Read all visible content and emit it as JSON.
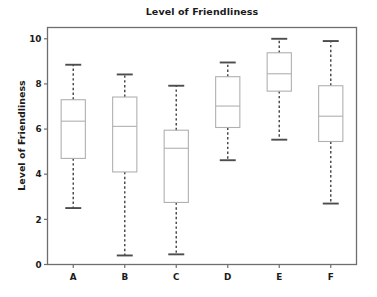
{
  "chart_data": {
    "type": "box",
    "title": "Level of Friendliness",
    "xlabel": "",
    "ylabel": "Level of Friendliness",
    "categories": [
      "A",
      "B",
      "C",
      "D",
      "E",
      "F"
    ],
    "ylim": [
      0,
      10.5
    ],
    "yticks": [
      0,
      2,
      4,
      6,
      8,
      10
    ],
    "ytick_labels": [
      "0",
      "2",
      "4",
      "6",
      "8",
      "10"
    ],
    "grid": false,
    "legend": null,
    "box_color": "#b0b0b0",
    "median_color": "#b0b0b0",
    "whisker_color": "#4d4d4d",
    "cap_color": "#4d4d4d",
    "frame_color": "#6e6e6e",
    "background": "#ffffff",
    "boxes": [
      {
        "label": "A",
        "whisker_low": 2.5,
        "q1": 4.7,
        "median": 6.35,
        "q3": 7.3,
        "whisker_high": 8.85
      },
      {
        "label": "B",
        "whisker_low": 0.4,
        "q1": 4.1,
        "median": 6.12,
        "q3": 7.42,
        "whisker_high": 8.42
      },
      {
        "label": "C",
        "whisker_low": 0.45,
        "q1": 2.75,
        "median": 5.15,
        "q3": 5.95,
        "whisker_high": 7.92
      },
      {
        "label": "D",
        "whisker_low": 4.62,
        "q1": 6.07,
        "median": 7.02,
        "q3": 8.32,
        "whisker_high": 8.95
      },
      {
        "label": "E",
        "whisker_low": 5.53,
        "q1": 7.68,
        "median": 8.45,
        "q3": 9.38,
        "whisker_high": 10.0
      },
      {
        "label": "F",
        "whisker_low": 2.7,
        "q1": 5.45,
        "median": 6.57,
        "q3": 7.92,
        "whisker_high": 9.9
      }
    ]
  }
}
